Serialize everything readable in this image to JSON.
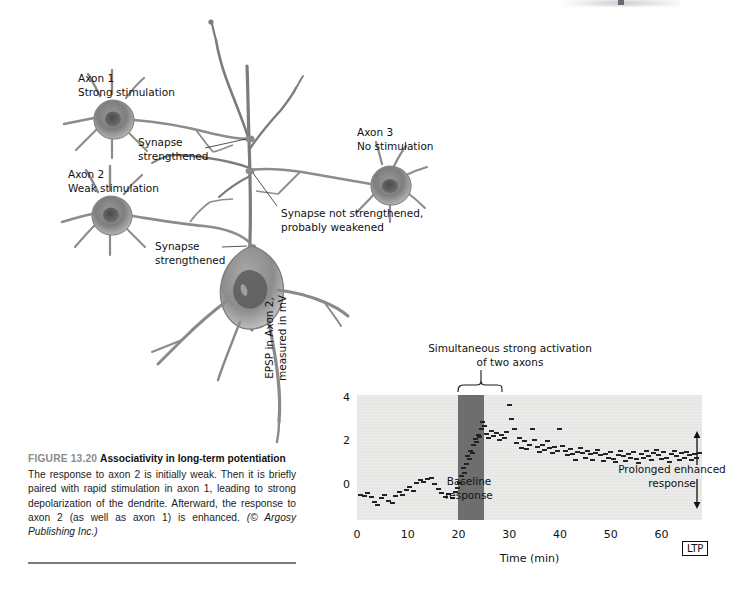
{
  "figure": {
    "number": "FIGURE 13.20",
    "title": "Associativity in long-term potentiation",
    "body": "The response to axon 2 is initially weak. Then it is briefly paired with rapid stimulation in axon 1, leading to strong depolarization of the dendrite. Afterward, the response to axon 2 (as well as axon 1) is enhanced.",
    "credit": "(© Argosy Publishing Inc.)"
  },
  "diagram": {
    "labels": {
      "axon1": "Axon 1\nStrong stimulation",
      "axon2": "Axon 2\nWeak stimulation",
      "axon3": "Axon 3\nNo stimulation",
      "synapse_top": "Synapse\nstrengthened",
      "synapse_bottom": "Synapse\nstrengthened",
      "synapse_weak": "Synapse not strengthened,\nprobably weakened"
    }
  },
  "chart_data": {
    "type": "scatter",
    "title": "",
    "xlabel": "Time (min)",
    "ylabel": "EPSP in Axon 2,\nmeasured in mV",
    "xlim": [
      0,
      68
    ],
    "ylim": [
      -1.6,
      4.2
    ],
    "xticks": [
      0,
      10,
      20,
      30,
      40,
      50,
      60
    ],
    "yticks": [
      0,
      2,
      4
    ],
    "grid": false,
    "legend": null,
    "annotations": [
      {
        "name": "baseline-response",
        "text": "Baseline\nresponse",
        "x": 8,
        "y": 2.3
      },
      {
        "name": "prolonged-enhanced-response",
        "text": "Prolonged enhanced\nresponse",
        "x": 48,
        "y": 2.9
      },
      {
        "name": "simultaneous-activation",
        "text": "Simultaneous strong activation\nof two axons",
        "x": 22.5,
        "y": 4.9
      },
      {
        "name": "ltp-marker",
        "text": "LTP",
        "x": 56,
        "y": 0.5
      }
    ],
    "shaded_region": {
      "name": "stimulation-period",
      "x0": 20,
      "x1": 25,
      "color": "#6e6e6e"
    },
    "marker_color": "#232323",
    "plot_background": "#e7e7e5",
    "points": [
      [
        0.6,
        -0.45
      ],
      [
        1.4,
        -0.5
      ],
      [
        2.1,
        -0.35
      ],
      [
        2.8,
        -0.55
      ],
      [
        3.4,
        -0.75
      ],
      [
        4.1,
        -0.9
      ],
      [
        4.8,
        -0.6
      ],
      [
        5.5,
        -0.45
      ],
      [
        6.2,
        -0.7
      ],
      [
        6.9,
        -0.8
      ],
      [
        7.6,
        -0.5
      ],
      [
        8.3,
        -0.3
      ],
      [
        9.0,
        -0.45
      ],
      [
        9.7,
        -0.2
      ],
      [
        10.4,
        -0.05
      ],
      [
        11.1,
        -0.25
      ],
      [
        11.8,
        0.1
      ],
      [
        12.5,
        0.25
      ],
      [
        13.2,
        0.15
      ],
      [
        13.9,
        0.3
      ],
      [
        14.6,
        0.35
      ],
      [
        15.3,
        0.05
      ],
      [
        16.0,
        -0.15
      ],
      [
        16.7,
        -0.35
      ],
      [
        17.4,
        -0.55
      ],
      [
        18.1,
        -0.4
      ],
      [
        18.8,
        -0.6
      ],
      [
        19.4,
        -0.3
      ],
      [
        19.9,
        -0.1
      ],
      [
        20.3,
        0.1
      ],
      [
        20.6,
        0.45
      ],
      [
        20.9,
        0.8
      ],
      [
        21.2,
        0.6
      ],
      [
        21.5,
        1.0
      ],
      [
        21.8,
        1.35
      ],
      [
        22.1,
        1.25
      ],
      [
        22.4,
        1.6
      ],
      [
        22.7,
        1.5
      ],
      [
        23.0,
        1.9
      ],
      [
        23.3,
        2.15
      ],
      [
        23.6,
        2.0
      ],
      [
        23.9,
        2.35
      ],
      [
        24.2,
        2.25
      ],
      [
        24.5,
        2.6
      ],
      [
        24.8,
        2.95
      ],
      [
        25.2,
        2.75
      ],
      [
        25.6,
        2.4
      ],
      [
        26.0,
        2.2
      ],
      [
        26.5,
        2.55
      ],
      [
        27.0,
        2.3
      ],
      [
        27.5,
        2.45
      ],
      [
        28.0,
        2.1
      ],
      [
        28.5,
        2.35
      ],
      [
        29.0,
        2.2
      ],
      [
        29.5,
        2.5
      ],
      [
        30.0,
        3.75
      ],
      [
        30.5,
        3.1
      ],
      [
        31.0,
        2.6
      ],
      [
        31.5,
        1.95
      ],
      [
        32.0,
        2.2
      ],
      [
        32.5,
        1.75
      ],
      [
        33.0,
        2.05
      ],
      [
        33.5,
        1.7
      ],
      [
        34.0,
        1.9
      ],
      [
        34.5,
        2.6
      ],
      [
        35.0,
        2.1
      ],
      [
        35.5,
        1.8
      ],
      [
        36.0,
        1.55
      ],
      [
        36.5,
        1.9
      ],
      [
        37.0,
        1.65
      ],
      [
        37.5,
        2.05
      ],
      [
        38.0,
        1.75
      ],
      [
        38.5,
        1.5
      ],
      [
        39.0,
        1.8
      ],
      [
        39.5,
        1.6
      ],
      [
        40.0,
        2.6
      ],
      [
        40.5,
        1.85
      ],
      [
        41.0,
        1.6
      ],
      [
        41.5,
        1.4
      ],
      [
        42.0,
        1.7
      ],
      [
        42.5,
        1.45
      ],
      [
        43.0,
        1.2
      ],
      [
        43.5,
        1.55
      ],
      [
        44.0,
        1.75
      ],
      [
        44.5,
        1.5
      ],
      [
        45.0,
        1.3
      ],
      [
        45.5,
        1.6
      ],
      [
        46.0,
        1.45
      ],
      [
        46.5,
        1.2
      ],
      [
        47.0,
        1.5
      ],
      [
        47.5,
        1.65
      ],
      [
        48.0,
        1.4
      ],
      [
        48.5,
        1.15
      ],
      [
        49.0,
        1.45
      ],
      [
        49.5,
        1.3
      ],
      [
        50.0,
        1.55
      ],
      [
        50.5,
        1.25
      ],
      [
        51.0,
        1.1
      ],
      [
        51.5,
        1.4
      ],
      [
        52.0,
        1.6
      ],
      [
        52.5,
        1.35
      ],
      [
        53.0,
        1.15
      ],
      [
        53.5,
        1.45
      ],
      [
        54.0,
        1.3
      ],
      [
        54.5,
        1.55
      ],
      [
        55.0,
        1.25
      ],
      [
        55.5,
        1.05
      ],
      [
        56.0,
        1.45
      ],
      [
        56.5,
        1.3
      ],
      [
        57.0,
        1.6
      ],
      [
        57.5,
        1.35
      ],
      [
        58.0,
        1.2
      ],
      [
        58.5,
        1.5
      ],
      [
        59.0,
        1.65
      ],
      [
        59.5,
        1.4
      ],
      [
        60.0,
        1.25
      ],
      [
        60.5,
        1.55
      ],
      [
        61.0,
        1.3
      ],
      [
        61.5,
        1.1
      ],
      [
        62.0,
        1.45
      ],
      [
        62.5,
        1.6
      ],
      [
        63.0,
        1.35
      ],
      [
        63.5,
        1.2
      ],
      [
        64.0,
        1.5
      ],
      [
        64.5,
        1.3
      ],
      [
        65.0,
        1.55
      ],
      [
        65.5,
        1.4
      ],
      [
        66.0,
        1.2
      ],
      [
        66.5,
        1.45
      ],
      [
        67.0,
        1.3
      ],
      [
        67.5,
        1.5
      ]
    ]
  }
}
